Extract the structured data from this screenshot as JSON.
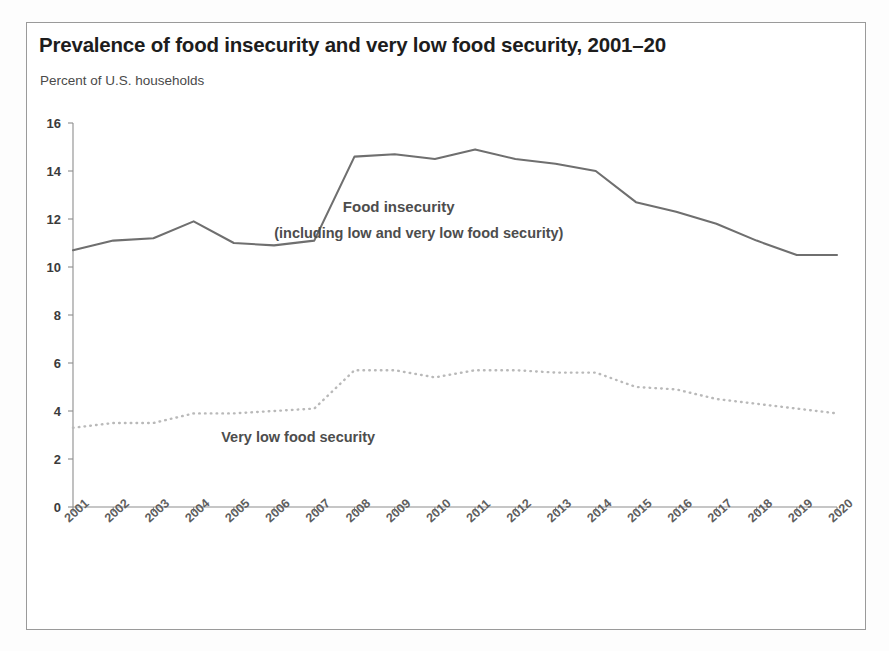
{
  "figure": {
    "title": "Prevalence of food insecurity and very low food security, 2001–20",
    "subtitle": "Percent of U.S. households"
  },
  "annotations": {
    "food_insecurity_line1": "Food insecurity",
    "food_insecurity_line2": "(including low and very low food security)",
    "very_low_label": "Very low food security"
  },
  "colors": {
    "frame_border": "#9a9a9a",
    "axis": "#8d8d8d",
    "food_insecurity_series": "#6f6f6f",
    "very_low_series": "#b9b9b9",
    "title_text": "#1d1d1d",
    "subtitle_text": "#4a4a4a",
    "background": "#ffffff"
  },
  "chart_data": {
    "type": "line",
    "title": "Prevalence of food insecurity and very low food security, 2001–20",
    "subtitle": "Percent of U.S. households",
    "xlabel": "",
    "ylabel": "Percent of U.S. households",
    "x": [
      2001,
      2002,
      2003,
      2004,
      2005,
      2006,
      2007,
      2008,
      2009,
      2010,
      2011,
      2012,
      2013,
      2014,
      2015,
      2016,
      2017,
      2018,
      2019,
      2020
    ],
    "xtick_labels": [
      "2001",
      "2002",
      "2003",
      "2004",
      "2005",
      "2006",
      "2007",
      "2008",
      "2009",
      "2010",
      "2011",
      "2012",
      "2013",
      "2014",
      "2015",
      "2016",
      "2017",
      "2018",
      "2019",
      "2020"
    ],
    "ylim": [
      0,
      16
    ],
    "yticks": [
      0,
      2,
      4,
      6,
      8,
      10,
      12,
      14,
      16
    ],
    "ytick_labels": [
      "0",
      "2",
      "4",
      "6",
      "8",
      "10",
      "12",
      "14",
      "16"
    ],
    "xlim": [
      2001,
      2020
    ],
    "grid": false,
    "legend": "inline-annotations",
    "series": [
      {
        "name": "Food insecurity (including low and very low food security)",
        "style": "solid",
        "color": "#6f6f6f",
        "values": [
          10.7,
          11.1,
          11.2,
          11.9,
          11.0,
          10.9,
          11.1,
          14.6,
          14.7,
          14.5,
          14.9,
          14.5,
          14.3,
          14.0,
          12.7,
          12.3,
          11.8,
          11.1,
          10.5,
          10.5
        ]
      },
      {
        "name": "Very low food security",
        "style": "dotted",
        "color": "#b9b9b9",
        "values": [
          3.3,
          3.5,
          3.5,
          3.9,
          3.9,
          4.0,
          4.1,
          5.7,
          5.7,
          5.4,
          5.7,
          5.7,
          5.6,
          5.6,
          5.0,
          4.9,
          4.5,
          4.3,
          4.1,
          3.9
        ]
      }
    ],
    "annotations": [
      {
        "text": "Food insecurity",
        "x": 2009.1,
        "y": 12.3
      },
      {
        "text": "(including low and very low food security)",
        "x": 2009.6,
        "y": 11.2
      },
      {
        "text": "Very low food security",
        "x": 2006.6,
        "y": 2.7
      }
    ]
  }
}
